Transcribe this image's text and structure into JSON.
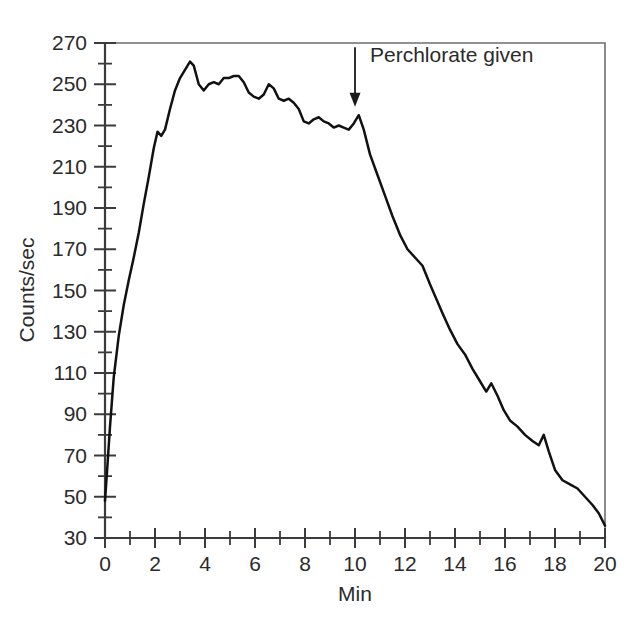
{
  "chart_data": {
    "type": "line",
    "title": "",
    "xlabel": "Min",
    "ylabel": "Counts/sec",
    "xlim": [
      0,
      20
    ],
    "ylim": [
      30,
      270
    ],
    "x_major_ticks": [
      0,
      2,
      4,
      6,
      8,
      10,
      12,
      14,
      16,
      18,
      20
    ],
    "x_major_tick_labels": [
      "0",
      "2",
      "4",
      "6",
      "8",
      "10",
      "12",
      "14",
      "16",
      "18",
      "20"
    ],
    "x_minor_tick_step": 1,
    "y_major_ticks": [
      30,
      50,
      70,
      90,
      110,
      130,
      150,
      170,
      190,
      210,
      230,
      250,
      270
    ],
    "y_major_tick_labels": [
      "30",
      "50",
      "70",
      "90",
      "110",
      "130",
      "150",
      "170",
      "190",
      "210",
      "230",
      "250",
      "270"
    ],
    "y_minor_tick_step": 10,
    "grid": false,
    "legend": null,
    "line_color": "#111111",
    "annotations": [
      {
        "name": "perchlorate-given",
        "text": "Perchlorate given",
        "x": 10,
        "arrow_tail_y": 268,
        "arrow_head_y": 243,
        "text_x": 10.6,
        "text_y": 264
      }
    ],
    "series": [
      {
        "name": "radioiodine uptake",
        "x": [
          0.0,
          0.08,
          0.2,
          0.35,
          0.55,
          0.75,
          0.95,
          1.15,
          1.35,
          1.55,
          1.75,
          1.95,
          2.1,
          2.25,
          2.4,
          2.6,
          2.8,
          3.0,
          3.2,
          3.4,
          3.55,
          3.75,
          3.95,
          4.15,
          4.35,
          4.55,
          4.75,
          4.95,
          5.15,
          5.35,
          5.55,
          5.75,
          5.95,
          6.15,
          6.35,
          6.55,
          6.75,
          6.95,
          7.15,
          7.35,
          7.55,
          7.75,
          7.95,
          8.15,
          8.35,
          8.55,
          8.75,
          8.95,
          9.15,
          9.35,
          9.55,
          9.75,
          9.95,
          10.15,
          10.35,
          10.6,
          10.9,
          11.2,
          11.5,
          11.8,
          12.1,
          12.4,
          12.7,
          13.0,
          13.25,
          13.5,
          13.8,
          14.1,
          14.4,
          14.7,
          15.0,
          15.25,
          15.45,
          15.7,
          15.95,
          16.2,
          16.5,
          16.8,
          17.1,
          17.35,
          17.55,
          17.75,
          18.0,
          18.3,
          18.6,
          18.9,
          19.2,
          19.5,
          19.75,
          20.0
        ],
        "y": [
          48,
          62,
          84,
          108,
          128,
          143,
          155,
          166,
          178,
          192,
          205,
          219,
          227,
          225,
          228,
          238,
          247,
          253,
          257,
          261,
          259,
          250,
          247,
          250,
          251,
          250,
          253,
          253,
          254,
          254,
          251,
          246,
          244,
          243,
          245,
          250,
          248,
          243,
          242,
          243,
          241,
          238,
          232,
          231,
          233,
          234,
          232,
          231,
          229,
          230,
          229,
          228,
          231,
          235,
          228,
          216,
          206,
          196,
          186,
          177,
          170,
          166,
          162,
          153,
          146,
          139,
          131,
          124,
          119,
          112,
          106,
          101,
          105,
          99,
          92,
          87,
          84,
          80,
          77,
          75,
          80,
          72,
          63,
          58,
          56,
          54,
          50,
          46,
          42,
          36
        ]
      }
    ]
  }
}
